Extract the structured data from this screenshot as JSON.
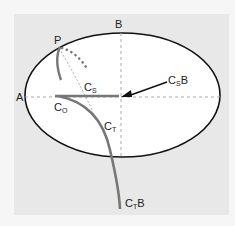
{
  "diagram": {
    "type": "ellipse-curve-diagram",
    "labels": {
      "A": "A",
      "B": "B",
      "P": "P",
      "Cs": {
        "main": "C",
        "sub": "S",
        "suffix": ""
      },
      "Co": {
        "main": "C",
        "sub": "O",
        "suffix": ""
      },
      "Ct": {
        "main": "C",
        "sub": "T",
        "suffix": ""
      },
      "CsB": {
        "main": "C",
        "sub": "S",
        "suffix": "B"
      },
      "CtB": {
        "main": "C",
        "sub": "T",
        "suffix": "B"
      }
    },
    "colors": {
      "background": "#f6f6f6",
      "panel": "#e8e8e8",
      "ellipse_fill": "#ffffff",
      "ellipse_stroke": "#111111",
      "curve": "#777777",
      "dashed_axis": "#aaaaaa",
      "arrow": "#111111"
    }
  }
}
